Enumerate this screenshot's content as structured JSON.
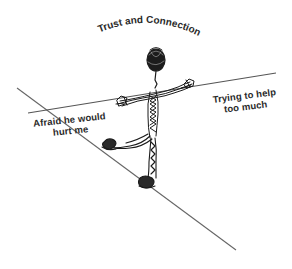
{
  "diagram": {
    "title": "Trust and Connection",
    "labels": {
      "left": "Afraid he would hurt me",
      "left_line1": "Afraid he would",
      "left_line2": "hurt me",
      "right": "Trying to help too much",
      "right_line1": "Trying to help",
      "right_line2": "too much"
    },
    "figure": "tightrope-walker",
    "elements": {
      "balance_pole": "horizontal line held by figure",
      "tightrope": "diagonal line figure walks on"
    },
    "colors": {
      "ink": "#2a2a2a",
      "line": "#555555",
      "background": "#ffffff"
    }
  }
}
